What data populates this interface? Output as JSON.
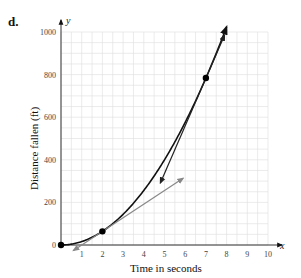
{
  "panel_label": "d.",
  "chart_data": {
    "type": "line",
    "title": "",
    "xlabel": "Time in seconds",
    "ylabel": "Distance fallen (ft)",
    "x_axis_name": "x",
    "y_axis_name": "y",
    "xlim": [
      0,
      10
    ],
    "ylim": [
      0,
      1000
    ],
    "x_ticks": [
      1,
      2,
      3,
      4,
      5,
      6,
      7,
      8,
      9,
      10
    ],
    "y_ticks": [
      0,
      200,
      400,
      600,
      800,
      1000
    ],
    "grid": true,
    "legend": null,
    "series": [
      {
        "name": "distance curve d = 16t^2",
        "color": "#111111",
        "x": [
          0,
          1,
          2,
          3,
          4,
          5,
          6,
          7,
          8
        ],
        "values": [
          0,
          16,
          64,
          144,
          256,
          400,
          576,
          784,
          1024
        ]
      },
      {
        "name": "tangent at t=2",
        "color": "#888888",
        "x": [
          0.6,
          5.9
        ],
        "values": [
          -26,
          313
        ]
      },
      {
        "name": "tangent at t=7",
        "color": "#222222",
        "x": [
          4.8,
          7.9
        ],
        "values": [
          291,
          985
        ]
      }
    ],
    "points": [
      {
        "x": 0,
        "y": 0
      },
      {
        "x": 2,
        "y": 64
      },
      {
        "x": 7,
        "y": 784
      }
    ]
  }
}
